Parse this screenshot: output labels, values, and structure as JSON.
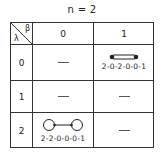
{
  "title": "n = 2",
  "table": {
    "corner": {
      "column_symbol": "β",
      "row_symbol": "λ"
    },
    "columns": [
      "0",
      "1"
    ],
    "rows": [
      {
        "label": "0",
        "cells": [
          {
            "empty": "—"
          },
          {
            "diagram": "double-bond-rod",
            "label": "2-0-2-0-0-1"
          }
        ]
      },
      {
        "label": "1",
        "cells": [
          {
            "empty": "—"
          },
          {
            "empty": "—"
          }
        ]
      },
      {
        "label": "2",
        "cells": [
          {
            "diagram": "two-loops-connected",
            "label": "2-2-0-0-0-1"
          },
          {
            "empty": "—"
          }
        ]
      }
    ]
  }
}
